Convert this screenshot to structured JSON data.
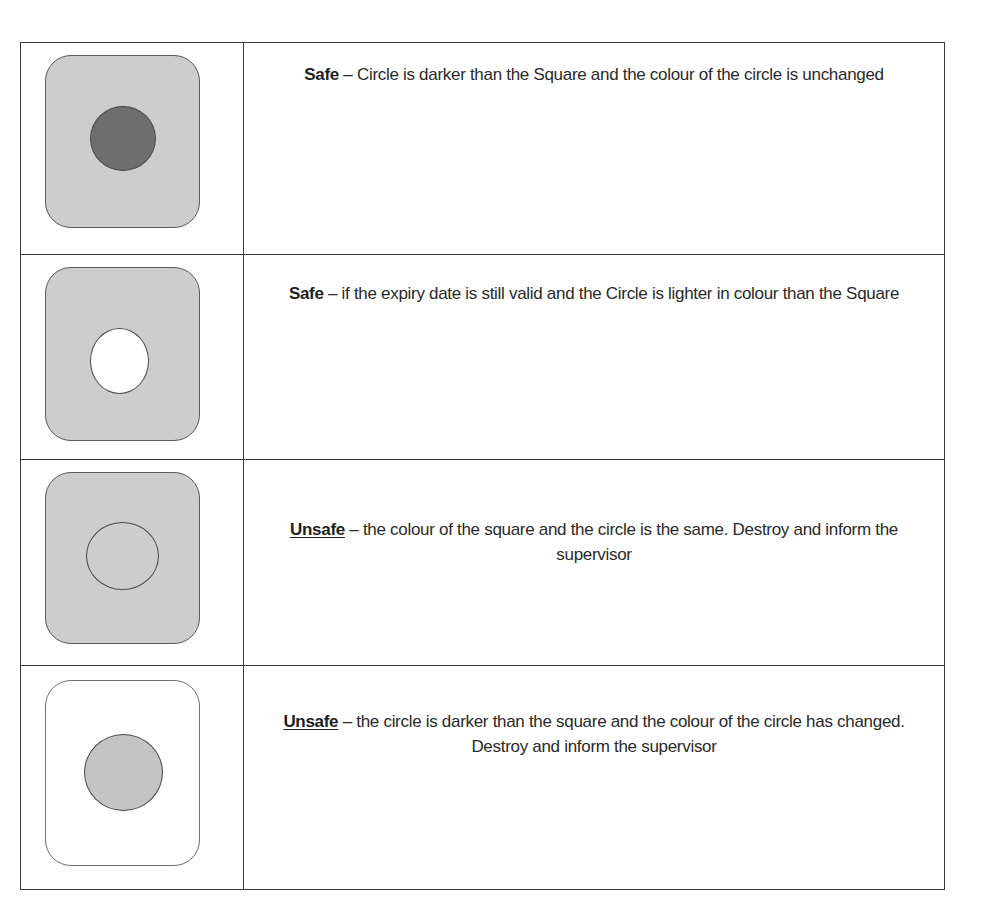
{
  "colors": {
    "border": "#3a3a3a",
    "square_fill": "#cdcdcd",
    "circle_dark": "#6e6e6e",
    "circle_light": "#ffffff",
    "circle_same": "#cdcdcd",
    "circle_mid": "#c4c4c4",
    "square_white": "#ffffff"
  },
  "rows": [
    {
      "icon": "rounded-square-dark-circle-icon",
      "square_fill": "#cdcdcd",
      "circle_fill": "#6e6e6e",
      "verdict": "Safe",
      "verdict_underlined": false,
      "description": " – Circle is darker than the Square and the colour of the circle is unchanged"
    },
    {
      "icon": "rounded-square-white-circle-icon",
      "square_fill": "#cdcdcd",
      "circle_fill": "#ffffff",
      "verdict": "Safe",
      "verdict_underlined": false,
      "description": " – if the expiry date is still valid and the Circle is lighter in colour than the Square"
    },
    {
      "icon": "rounded-square-same-circle-icon",
      "square_fill": "#cdcdcd",
      "circle_fill": "#cdcdcd",
      "verdict": "Unsafe",
      "verdict_underlined": true,
      "description": " – the colour of the square and the circle is the same. Destroy and inform the supervisor"
    },
    {
      "icon": "white-square-grey-circle-icon",
      "square_fill": "#ffffff",
      "circle_fill": "#c4c4c4",
      "verdict": "Unsafe",
      "verdict_underlined": true,
      "description": " – the circle is darker than the square and the colour of the circle has changed. Destroy and inform the supervisor"
    }
  ]
}
